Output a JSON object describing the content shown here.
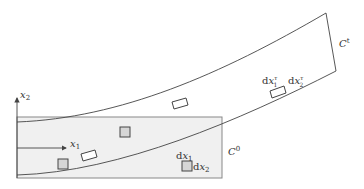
{
  "diagram": {
    "colors": {
      "stroke": "#444444",
      "region_fill": "#f0f0f0",
      "region_stroke": "#888888",
      "element_fill": "#d6d6d6",
      "text": "#333333"
    },
    "axes": {
      "x1_label": "x",
      "x1_sub": "1",
      "x2_label": "x",
      "x2_sub": "2"
    },
    "regions": {
      "reference_label": "C",
      "reference_sup": "0",
      "current_label": "C",
      "current_sup": "t"
    },
    "reference_element": {
      "dx1_d": "d",
      "dx1_x": "x",
      "dx1_sub": "1",
      "dx2_d": "d",
      "dx2_x": "x",
      "dx2_sub": "2"
    },
    "current_element": {
      "dx1_d": "d",
      "dx1_x": "x",
      "dx1_sup": "τ",
      "dx1_sub": "1",
      "dx2_d": "d",
      "dx2_x": "x",
      "dx2_sup": "τ",
      "dx2_sub": "2"
    }
  }
}
